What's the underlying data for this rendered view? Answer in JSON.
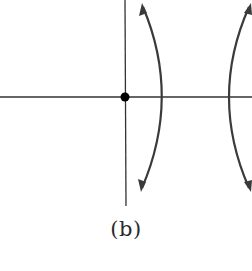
{
  "figure": {
    "caption": "(b)",
    "colors": {
      "stroke": "#3a3a3a",
      "axis": "#333333",
      "dot": "#000000",
      "background": "#ffffff"
    },
    "axes": {
      "horizontal": {
        "x1": 0,
        "y1": 97,
        "x2": 252,
        "y2": 97
      },
      "vertical": {
        "x1": 125,
        "y1": 0,
        "x2": 126,
        "y2": 206
      }
    },
    "origin_point": {
      "cx": 125,
      "cy": 97,
      "r": 4.5
    },
    "branches": [
      {
        "name": "left-branch",
        "path": "M 143 7 Q 181 97 142 188"
      },
      {
        "name": "right-branch",
        "path": "M 249 7 Q 209 97 249 188"
      }
    ],
    "arrowheads": [
      {
        "name": "left-branch-top-arrow",
        "points": "142,3 139,16 147,13"
      },
      {
        "name": "left-branch-bottom-arrow",
        "points": "141,192 138,179 146,182"
      },
      {
        "name": "right-branch-top-arrow",
        "points": "251,3 244,13 252,15"
      },
      {
        "name": "right-branch-bottom-arrow",
        "points": "251,192 244,182 252,180"
      }
    ]
  }
}
